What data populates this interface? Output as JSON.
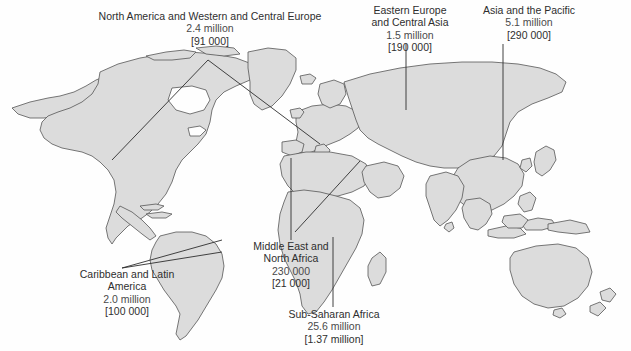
{
  "figure": {
    "type": "world-map-infographic",
    "background_color": "#fefefe",
    "land_fill": "#dcdcdc",
    "land_stroke": "#4a4a4a",
    "text_color": "#2e2e2e",
    "leader_line_color": "#2e2e2e"
  },
  "regions": [
    {
      "id": "north-america-western-central-europe",
      "title": "North America and Western and Central Europe",
      "value": "2.4 million",
      "bracket": "[91 000]"
    },
    {
      "id": "eastern-europe-central-asia",
      "title": "Eastern Europe\nand Central Asia",
      "title_line1": "Eastern Europe",
      "title_line2": "and Central Asia",
      "value": "1.5 million",
      "bracket": "[190 000]"
    },
    {
      "id": "asia-and-the-pacific",
      "title": "Asia and the Pacific",
      "value": "5.1 million",
      "bracket": "[290 000]"
    },
    {
      "id": "middle-east-north-africa",
      "title_line1": "Middle East and",
      "title_line2": "North Africa",
      "value": "230 000",
      "bracket": "[21 000]"
    },
    {
      "id": "caribbean-latin-america",
      "title_line1": "Caribbean and Latin",
      "title_line2": "America",
      "value": "2.0 million",
      "bracket": "[100 000]"
    },
    {
      "id": "sub-saharan-africa",
      "title": "Sub-Saharan Africa",
      "value": "25.6 million",
      "bracket": "[1.37 million]"
    }
  ]
}
